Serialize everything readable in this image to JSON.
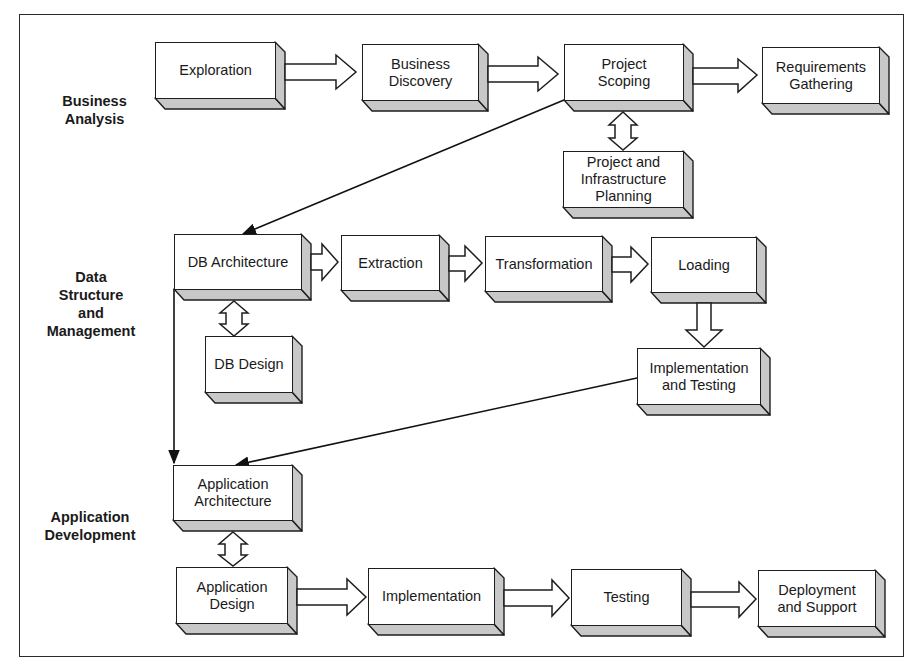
{
  "diagram": {
    "phases": [
      {
        "id": "business_analysis",
        "label": "Business\nAnalysis"
      },
      {
        "id": "data_structure",
        "label": "Data\nStructure\nand\nManagement"
      },
      {
        "id": "app_dev",
        "label": "Application\nDevelopment"
      }
    ],
    "boxes": [
      {
        "id": "exploration",
        "label": "Exploration"
      },
      {
        "id": "business_discovery",
        "label": "Business\nDiscovery"
      },
      {
        "id": "project_scoping",
        "label": "Project\nScoping"
      },
      {
        "id": "requirements_gathering",
        "label": "Requirements\nGathering"
      },
      {
        "id": "project_infra_planning",
        "label": "Project and\nInfrastructure\nPlanning"
      },
      {
        "id": "db_architecture",
        "label": "DB Architecture"
      },
      {
        "id": "extraction",
        "label": "Extraction"
      },
      {
        "id": "transformation",
        "label": "Transformation"
      },
      {
        "id": "loading",
        "label": "Loading"
      },
      {
        "id": "db_design",
        "label": "DB Design"
      },
      {
        "id": "impl_testing",
        "label": "Implementation\nand Testing"
      },
      {
        "id": "app_architecture",
        "label": "Application\nArchitecture"
      },
      {
        "id": "app_design",
        "label": "Application\nDesign"
      },
      {
        "id": "implementation",
        "label": "Implementation"
      },
      {
        "id": "testing",
        "label": "Testing"
      },
      {
        "id": "deployment_support",
        "label": "Deployment\nand Support"
      }
    ],
    "connections": [
      {
        "from": "exploration",
        "to": "business_discovery",
        "type": "block-arrow"
      },
      {
        "from": "business_discovery",
        "to": "project_scoping",
        "type": "block-arrow"
      },
      {
        "from": "project_scoping",
        "to": "requirements_gathering",
        "type": "block-arrow"
      },
      {
        "from": "project_scoping",
        "to": "project_infra_planning",
        "type": "double-block-arrow"
      },
      {
        "from": "project_scoping",
        "to": "db_architecture",
        "type": "line-arrow"
      },
      {
        "from": "db_architecture",
        "to": "extraction",
        "type": "block-arrow"
      },
      {
        "from": "extraction",
        "to": "transformation",
        "type": "block-arrow"
      },
      {
        "from": "transformation",
        "to": "loading",
        "type": "block-arrow"
      },
      {
        "from": "db_architecture",
        "to": "db_design",
        "type": "double-block-arrow"
      },
      {
        "from": "loading",
        "to": "impl_testing",
        "type": "block-arrow-down"
      },
      {
        "from": "impl_testing",
        "to": "app_architecture",
        "type": "line-arrow"
      },
      {
        "from": "db_architecture",
        "to": "app_architecture",
        "type": "line-arrow"
      },
      {
        "from": "app_architecture",
        "to": "app_design",
        "type": "double-block-arrow"
      },
      {
        "from": "app_design",
        "to": "implementation",
        "type": "block-arrow"
      },
      {
        "from": "implementation",
        "to": "testing",
        "type": "block-arrow"
      },
      {
        "from": "testing",
        "to": "deployment_support",
        "type": "block-arrow"
      }
    ]
  }
}
